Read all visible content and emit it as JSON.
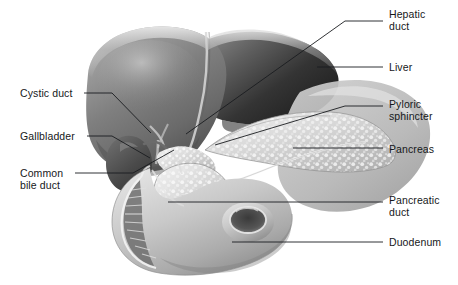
{
  "figure": {
    "background_color": "#ffffff",
    "leader_line_color": "#1a1c1f",
    "label_text_color": "#16181a",
    "palette": {
      "liver_dark": "#2b2b2b",
      "liver_mid": "#7d7d7d",
      "liver_light": "#a9a9a9",
      "liver_highlight": "#c4c4c4",
      "gallbladder": "#4a4a4a",
      "pancreas_light": "#d6d6d6",
      "pancreas_mottle": "#f0f0f0",
      "duodenum": "#bdbdbd",
      "duodenum_shadow": "#8e8e8e",
      "outline": "#6e6e6e"
    }
  },
  "labels": [
    {
      "id": "hepatic-duct",
      "text": "Hepatic\nduct",
      "side": "right",
      "x": 389,
      "y": 8,
      "leader": {
        "kind": "elbow",
        "points": "345,21 374,21",
        "extra": "345,21 225,105 186,134"
      }
    },
    {
      "id": "liver",
      "text": "Liver",
      "side": "right",
      "x": 389,
      "y": 61,
      "leader": {
        "kind": "straight",
        "points": "317,67 383,67"
      }
    },
    {
      "id": "pyloric-sphincter",
      "text": "Pyloric\nsphincter",
      "side": "right",
      "x": 389,
      "y": 98,
      "leader": {
        "kind": "elbow",
        "points": "345,106 383,106",
        "extra": "345,106 215,145"
      }
    },
    {
      "id": "pancreas",
      "text": "Pancreas",
      "side": "right",
      "x": 389,
      "y": 143,
      "leader": {
        "kind": "straight",
        "points": "293,148 383,148"
      }
    },
    {
      "id": "pancreatic-duct",
      "text": "Pancreatic\nduct",
      "side": "right",
      "x": 389,
      "y": 194,
      "leader": {
        "kind": "straight",
        "points": "168,202 383,202"
      }
    },
    {
      "id": "duodenum",
      "text": "Duodenum",
      "side": "right",
      "x": 389,
      "y": 236,
      "leader": {
        "kind": "straight",
        "points": "232,242 383,242"
      }
    },
    {
      "id": "cystic-duct",
      "text": "Cystic duct",
      "side": "left",
      "x": 20,
      "y": 87,
      "leader": {
        "kind": "elbow",
        "points": "84,93 112,93",
        "extra": "112,93 151,133"
      }
    },
    {
      "id": "gallbladder",
      "text": "Gallbladder",
      "side": "left",
      "x": 20,
      "y": 130,
      "leader": {
        "kind": "elbow",
        "points": "87,136 112,136",
        "extra": "112,136 150,158"
      }
    },
    {
      "id": "common-bile-duct",
      "text": "Common\nbile duct",
      "side": "left",
      "x": 20,
      "y": 167,
      "leader": {
        "kind": "elbow",
        "points": "75,173 133,173",
        "extra": "133,173 172,152"
      }
    }
  ]
}
